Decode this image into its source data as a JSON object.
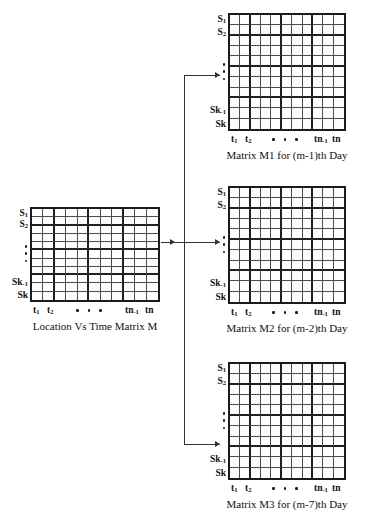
{
  "diagram": {
    "type": "matrix-decomposition-flow",
    "row_labels": {
      "first": "S1",
      "second": "S2",
      "second_last": "Sk-1",
      "last": "Sk",
      "ellipsis": "vertical-dots"
    },
    "col_labels": {
      "first": "t1",
      "second": "t2",
      "second_last": "tn-1",
      "last": "tn",
      "ellipsis": "horizontal-dots"
    },
    "grid": {
      "columns": 11,
      "rows": 11
    },
    "matrices": [
      {
        "id": "source",
        "caption": "Location Vs Time Matrix M"
      },
      {
        "id": "m1",
        "caption": "Matrix M1 for (m-1)th Day"
      },
      {
        "id": "m2",
        "caption": "Matrix M2 for (m-2)th Day"
      },
      {
        "id": "m3",
        "caption": "Matrix M3 for (m-7)th Day"
      }
    ],
    "colors": {
      "border": "#1b1b1b",
      "gridline": "#4a4a4a",
      "connector": "#333333",
      "background": "#ffffff"
    }
  }
}
